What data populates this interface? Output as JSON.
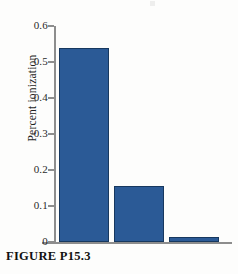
{
  "figure": {
    "caption": "FIGURE P15.3"
  },
  "chart_data": {
    "type": "bar",
    "title": "",
    "xlabel": "",
    "ylabel": "Percent ionization",
    "categories": [
      "",
      "",
      ""
    ],
    "values": [
      0.54,
      0.155,
      0.015
    ],
    "ylim": [
      0,
      0.6
    ],
    "yticks": [
      0,
      0.1,
      0.2,
      0.3,
      0.4,
      0.5,
      0.6
    ],
    "ytick_labels": [
      "0",
      "0.1",
      "0.2",
      "0.3",
      "0.4",
      "0.5",
      "0.6"
    ],
    "xticks": [],
    "xtick_labels": [],
    "grid": false,
    "legend": false,
    "bar_color": "#2b5a96",
    "bar_edge_color": "#17385f",
    "axis_color": "#8d8d8d"
  }
}
